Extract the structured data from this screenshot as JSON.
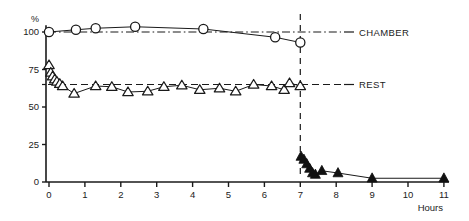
{
  "chart_data": {
    "type": "line",
    "title": "",
    "xlabel": "Hours",
    "ylabel": "%",
    "xlim": [
      -0.45,
      11.45
    ],
    "ylim": [
      0,
      108
    ],
    "xticks": [
      0,
      1,
      2,
      3,
      4,
      5,
      6,
      7,
      8,
      9,
      10,
      11
    ],
    "xtick_labels": [
      "0",
      "1",
      "2",
      "3",
      "4",
      "5",
      "6",
      "7",
      "8",
      "9",
      "10",
      "11"
    ],
    "yticks": [
      0,
      25,
      50,
      75,
      100
    ],
    "ytick_labels": [
      "0",
      "25",
      "50",
      "75",
      "100"
    ],
    "grid": false,
    "legend_position": "right-inline",
    "annotations": [
      {
        "name": "event-divider",
        "type": "vertical-dashed-line",
        "x": 7.0,
        "label": ""
      }
    ],
    "reference_lines": [
      {
        "name": "chamber-baseline",
        "y": 100,
        "style": "dash-dot",
        "label": "CHAMBER"
      },
      {
        "name": "rest-baseline",
        "y": 65,
        "style": "dashed",
        "label": "REST"
      }
    ],
    "series": [
      {
        "name": "CHAMBER",
        "marker": "open-circle",
        "label": "CHAMBER",
        "points": [
          {
            "x": 0.0,
            "y": 100.0
          },
          {
            "x": 0.75,
            "y": 101.5
          },
          {
            "x": 1.3,
            "y": 102.5
          },
          {
            "x": 2.4,
            "y": 103.5
          },
          {
            "x": 4.3,
            "y": 102.0
          },
          {
            "x": 6.3,
            "y": 96.5
          },
          {
            "x": 7.0,
            "y": 93.0
          }
        ]
      },
      {
        "name": "REST",
        "marker": "open-triangle",
        "label": "REST",
        "points": [
          {
            "x": 0.0,
            "y": 78.0
          },
          {
            "x": 0.05,
            "y": 73.0
          },
          {
            "x": 0.1,
            "y": 70.5
          },
          {
            "x": 0.16,
            "y": 68.5
          },
          {
            "x": 0.22,
            "y": 67.0
          },
          {
            "x": 0.3,
            "y": 65.5
          },
          {
            "x": 0.38,
            "y": 64.0
          },
          {
            "x": 0.7,
            "y": 59.0
          },
          {
            "x": 1.3,
            "y": 64.0
          },
          {
            "x": 1.75,
            "y": 63.5
          },
          {
            "x": 2.2,
            "y": 60.0
          },
          {
            "x": 2.75,
            "y": 60.5
          },
          {
            "x": 3.2,
            "y": 63.5
          },
          {
            "x": 3.7,
            "y": 64.5
          },
          {
            "x": 4.2,
            "y": 61.5
          },
          {
            "x": 4.75,
            "y": 62.5
          },
          {
            "x": 5.2,
            "y": 60.5
          },
          {
            "x": 5.7,
            "y": 65.0
          },
          {
            "x": 6.2,
            "y": 64.0
          },
          {
            "x": 6.55,
            "y": 61.5
          },
          {
            "x": 6.7,
            "y": 66.0
          },
          {
            "x": 7.0,
            "y": 64.0
          }
        ]
      },
      {
        "name": "POST-EXPOSURE",
        "marker": "filled-triangle",
        "label": "",
        "points": [
          {
            "x": 7.02,
            "y": 17.0
          },
          {
            "x": 7.1,
            "y": 15.0
          },
          {
            "x": 7.18,
            "y": 12.0
          },
          {
            "x": 7.26,
            "y": 9.0
          },
          {
            "x": 7.34,
            "y": 6.0
          },
          {
            "x": 7.42,
            "y": 5.0
          },
          {
            "x": 7.6,
            "y": 7.5
          },
          {
            "x": 8.05,
            "y": 6.0
          },
          {
            "x": 9.0,
            "y": 2.5
          },
          {
            "x": 11.0,
            "y": 2.5
          }
        ]
      }
    ]
  },
  "labels": {
    "y_axis_unit": "%",
    "x_axis_title": "Hours",
    "chamber": "CHAMBER",
    "rest": "REST"
  },
  "colors": {
    "ink": "#1a1a1a",
    "marker_fill": "#ffffff",
    "filled_marker": "#111111",
    "background": "#ffffff"
  }
}
